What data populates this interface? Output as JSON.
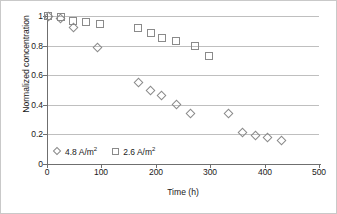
{
  "chart_data": {
    "type": "scatter",
    "title": "",
    "xlabel": "Time (h)",
    "ylabel": "Normalized concentration",
    "xlim": [
      0,
      500
    ],
    "ylim": [
      0,
      1.0
    ],
    "xticks": [
      "0",
      "100",
      "200",
      "300",
      "400",
      "500"
    ],
    "xtick_values": [
      0,
      100,
      200,
      300,
      400,
      500
    ],
    "yticks": [
      "0",
      "0.2",
      "0.4",
      "0.6",
      "0.8",
      "1"
    ],
    "ytick_values": [
      0,
      0.2,
      0.4,
      0.6,
      0.8,
      1.0
    ],
    "grid": "horizontal",
    "legend_position": "bottom-left",
    "series": [
      {
        "name": "4.8 A/m2",
        "label": "4.8 A/m",
        "label_sup": "2",
        "marker": "diamond-open",
        "color": "#8a8a8a",
        "points": [
          {
            "x": 2,
            "y": 0.995
          },
          {
            "x": 25,
            "y": 0.985
          },
          {
            "x": 48,
            "y": 0.925
          },
          {
            "x": 93,
            "y": 0.785
          },
          {
            "x": 168,
            "y": 0.55
          },
          {
            "x": 191,
            "y": 0.495
          },
          {
            "x": 211,
            "y": 0.462
          },
          {
            "x": 238,
            "y": 0.405
          },
          {
            "x": 264,
            "y": 0.34
          },
          {
            "x": 334,
            "y": 0.34
          },
          {
            "x": 359,
            "y": 0.215
          },
          {
            "x": 383,
            "y": 0.195
          },
          {
            "x": 406,
            "y": 0.178
          },
          {
            "x": 431,
            "y": 0.16
          }
        ]
      },
      {
        "name": "2.6 A/m2",
        "label": "2.6 A/m",
        "label_sup": "2",
        "marker": "square-open",
        "color": "#8a8a8a",
        "points": [
          {
            "x": 2,
            "y": 0.998
          },
          {
            "x": 25,
            "y": 0.99
          },
          {
            "x": 48,
            "y": 0.965
          },
          {
            "x": 72,
            "y": 0.958
          },
          {
            "x": 97,
            "y": 0.948
          },
          {
            "x": 168,
            "y": 0.917
          },
          {
            "x": 191,
            "y": 0.885
          },
          {
            "x": 211,
            "y": 0.852
          },
          {
            "x": 237,
            "y": 0.833
          },
          {
            "x": 272,
            "y": 0.798
          },
          {
            "x": 297,
            "y": 0.73
          }
        ]
      }
    ]
  }
}
